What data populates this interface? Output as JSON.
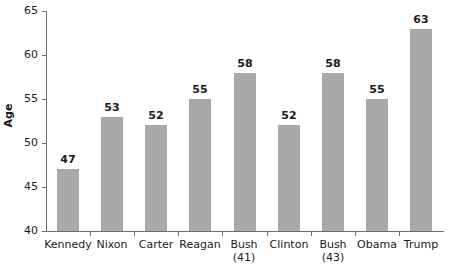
{
  "chart_data": {
    "type": "bar",
    "title": "",
    "xlabel": "",
    "ylabel": "Age",
    "ylim": [
      40,
      65
    ],
    "ytick_labels": [
      "65",
      "60",
      "55",
      "50",
      "45",
      "40"
    ],
    "ytick_values": [
      65,
      60,
      55,
      50,
      45,
      40
    ],
    "grid": false,
    "legend": null,
    "bar_color": "#a9a9a9",
    "axis_color": "#6e6e6e",
    "text_color": "#1a1a1a",
    "categories": [
      "Kennedy",
      "Nixon",
      "Carter",
      "Reagan",
      "Bush (41)",
      "Clinton",
      "Bush (43)",
      "Obama",
      "Trump"
    ],
    "category_lines": [
      [
        "Kennedy"
      ],
      [
        "Nixon"
      ],
      [
        "Carter"
      ],
      [
        "Reagan"
      ],
      [
        "Bush",
        "(41)"
      ],
      [
        "Clinton"
      ],
      [
        "Bush",
        "(43)"
      ],
      [
        "Obama"
      ],
      [
        "Trump"
      ]
    ],
    "values": [
      47,
      53,
      52,
      55,
      58,
      52,
      58,
      55,
      63
    ],
    "value_labels": [
      "47",
      "53",
      "52",
      "55",
      "58",
      "52",
      "58",
      "55",
      "63"
    ]
  }
}
